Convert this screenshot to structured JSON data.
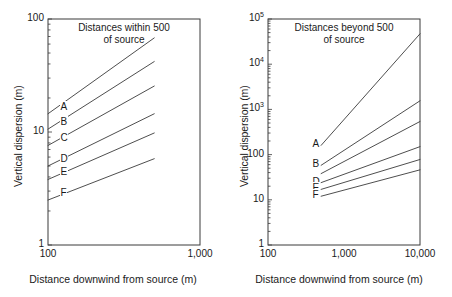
{
  "figure": {
    "background": "#ffffff",
    "line_color": "#3a3a3a",
    "text_color": "#1a1a1a"
  },
  "chart_data": [
    {
      "id": "left",
      "type": "line",
      "title": "Distances within 500\nof source",
      "xlabel": "Distance downwind from source (m)",
      "ylabel": "Vertical dispersion (m)",
      "xscale": "log",
      "yscale": "log",
      "xlim": [
        100,
        1000
      ],
      "ylim": [
        1,
        100
      ],
      "grid": false,
      "legend": "inline-curve-labels",
      "xticks": [
        {
          "value": 100,
          "label": "100"
        },
        {
          "value": 1000,
          "label": "1,000"
        }
      ],
      "yticks": [
        {
          "value": 1,
          "label": "1"
        },
        {
          "value": 10,
          "label": "10"
        },
        {
          "value": 100,
          "label": "100"
        }
      ],
      "series": [
        {
          "name": "A",
          "label": "A",
          "x": [
            100,
            500
          ],
          "y": [
            14.5,
            68
          ]
        },
        {
          "name": "B",
          "label": "B",
          "x": [
            100,
            500
          ],
          "y": [
            10.6,
            42
          ]
        },
        {
          "name": "C",
          "label": "C",
          "x": [
            100,
            500
          ],
          "y": [
            7.6,
            25.5
          ]
        },
        {
          "name": "D",
          "label": "D",
          "x": [
            100,
            500
          ],
          "y": [
            5.0,
            14.5
          ]
        },
        {
          "name": "E",
          "label": "E",
          "x": [
            100,
            500
          ],
          "y": [
            3.8,
            9.8
          ]
        },
        {
          "name": "F",
          "label": "F",
          "x": [
            100,
            500
          ],
          "y": [
            2.5,
            5.8
          ]
        }
      ]
    },
    {
      "id": "right",
      "type": "line",
      "title": "Distances beyond 500\nof source",
      "xlabel": "Distance downwind from source (m)",
      "ylabel": "Vertical dispersion (m)",
      "xscale": "log",
      "yscale": "log",
      "xlim": [
        100,
        10000
      ],
      "ylim": [
        1,
        100000
      ],
      "grid": false,
      "legend": "inline-curve-labels",
      "xticks": [
        {
          "value": 100,
          "label": "100"
        },
        {
          "value": 1000,
          "label": "1,000"
        },
        {
          "value": 10000,
          "label": "10,000"
        }
      ],
      "yticks": [
        {
          "value": 1,
          "label": "1",
          "sup": ""
        },
        {
          "value": 10,
          "label": "10",
          "sup": ""
        },
        {
          "value": 100,
          "label": "100",
          "sup": ""
        },
        {
          "value": 1000,
          "label": "10",
          "sup": "3"
        },
        {
          "value": 10000,
          "label": "10",
          "sup": "4"
        },
        {
          "value": 100000,
          "label": "10",
          "sup": "5"
        }
      ],
      "series": [
        {
          "name": "A",
          "label": "A",
          "x": [
            500,
            10000
          ],
          "y": [
            160,
            47000
          ]
        },
        {
          "name": "B",
          "label": "B",
          "x": [
            500,
            10000
          ],
          "y": [
            58,
            1550
          ]
        },
        {
          "name": "C",
          "label": "",
          "x": [
            500,
            10000
          ],
          "y": [
            38,
            540
          ]
        },
        {
          "name": "D",
          "label": "D",
          "x": [
            500,
            10000
          ],
          "y": [
            24,
            150
          ]
        },
        {
          "name": "E",
          "label": "E",
          "x": [
            500,
            10000
          ],
          "y": [
            17,
            78
          ]
        },
        {
          "name": "F",
          "label": "F",
          "x": [
            500,
            10000
          ],
          "y": [
            12,
            46
          ]
        }
      ]
    }
  ]
}
